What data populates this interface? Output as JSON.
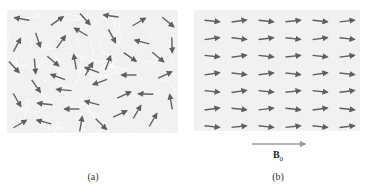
{
  "figure": {
    "panels": [
      {
        "id": "a",
        "caption": "(a)",
        "description": "Randomly oriented magnetic dipole moments in domains",
        "box": {
          "x": 7,
          "y": 10,
          "w": 171,
          "h": 123
        },
        "background": "#f1f1f1",
        "arrows": [
          [
            22,
            19,
            190
          ],
          [
            57,
            21,
            -35
          ],
          [
            85,
            19,
            48
          ],
          [
            111,
            16,
            188
          ],
          [
            139,
            22,
            -30
          ],
          [
            168,
            22,
            40
          ],
          [
            17,
            45,
            -62
          ],
          [
            38,
            40,
            72
          ],
          [
            61,
            42,
            -55
          ],
          [
            81,
            32,
            210
          ],
          [
            112,
            36,
            62
          ],
          [
            142,
            42,
            195
          ],
          [
            172,
            45,
            88
          ],
          [
            14,
            67,
            48
          ],
          [
            35,
            66,
            85
          ],
          [
            53,
            61,
            40
          ],
          [
            75,
            62,
            -100
          ],
          [
            92,
            70,
            200
          ],
          [
            108,
            63,
            -70
          ],
          [
            130,
            57,
            35
          ],
          [
            158,
            57,
            40
          ],
          [
            89,
            69,
            -60
          ],
          [
            58,
            77,
            200
          ],
          [
            129,
            75,
            180
          ],
          [
            165,
            75,
            -25
          ],
          [
            36,
            86,
            55
          ],
          [
            64,
            90,
            185
          ],
          [
            100,
            82,
            160
          ],
          [
            124,
            95,
            -25
          ],
          [
            146,
            94,
            182
          ],
          [
            171,
            102,
            -100
          ],
          [
            17,
            100,
            60
          ],
          [
            45,
            104,
            186
          ],
          [
            72,
            109,
            180
          ],
          [
            92,
            103,
            195
          ],
          [
            120,
            114,
            -25
          ],
          [
            137,
            112,
            -60
          ],
          [
            20,
            124,
            -30
          ],
          [
            44,
            122,
            195
          ],
          [
            81,
            124,
            -80
          ],
          [
            101,
            124,
            45
          ],
          [
            153,
            120,
            -60
          ]
        ]
      },
      {
        "id": "b",
        "caption": "(b)",
        "description": "Dipole moments aligned with external field B0",
        "box": {
          "x": 194,
          "y": 10,
          "w": 166,
          "h": 121
        },
        "background": "#f1f1f1",
        "grid": {
          "cols": 6,
          "rows": 7,
          "x0": 212,
          "dx": 27,
          "y0": 21,
          "dy": 17.6
        },
        "arrow_length": 15,
        "tilts": [
          [
            6,
            -8,
            6,
            -6,
            6,
            -7
          ],
          [
            -8,
            6,
            -7,
            6,
            -8,
            6
          ],
          [
            6,
            -8,
            6,
            -6,
            6,
            -7
          ],
          [
            -8,
            6,
            -7,
            6,
            -8,
            6
          ],
          [
            6,
            -8,
            6,
            -6,
            6,
            -7
          ],
          [
            -8,
            6,
            -7,
            6,
            -8,
            6
          ],
          [
            6,
            -6,
            6,
            -6,
            6,
            -7
          ]
        ]
      }
    ],
    "field_arrow": {
      "label": "B",
      "subscript": "0",
      "x1": 252,
      "x2": 305,
      "y": 144,
      "color": "#9a9a9a"
    },
    "arrow_color": "#5f5f5f"
  }
}
